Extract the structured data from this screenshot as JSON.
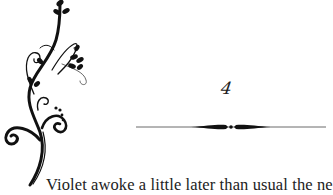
{
  "page": {
    "chapter_number": "4",
    "first_line": "Violet awoke a little later than usual the ne"
  },
  "decorations": {
    "flourish": "floral-vine-ornament",
    "divider": "ornamental-rule-divider"
  },
  "colors": {
    "ink": "#1a1a1a",
    "background": "#ffffff"
  }
}
